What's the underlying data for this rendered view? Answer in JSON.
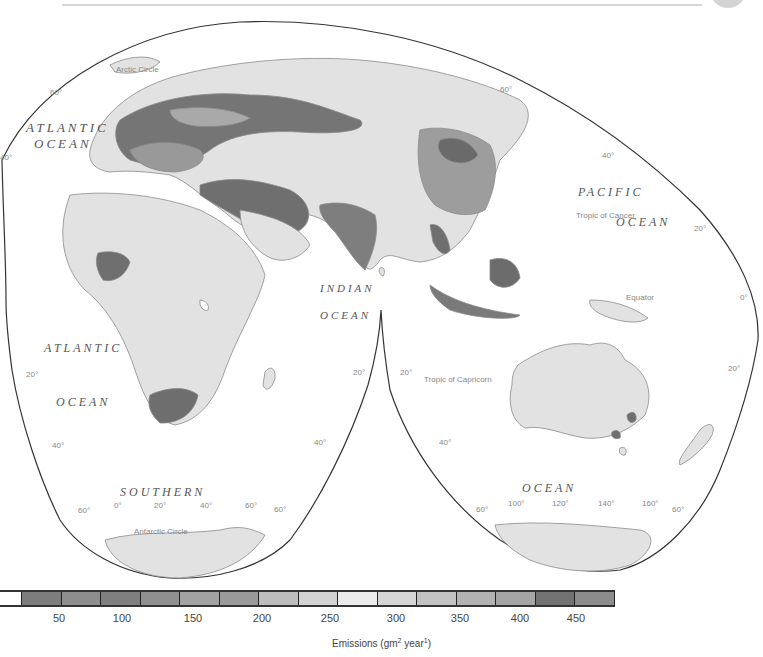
{
  "map": {
    "title": "Emissions map (Goode homolosine, interrupted)",
    "ocean_labels": {
      "atlantic_north": [
        "ATLANTIC",
        "OCEAN"
      ],
      "atlantic_south": [
        "ATLANTIC",
        "OCEAN"
      ],
      "pacific": [
        "PACIFIC",
        "OCEAN"
      ],
      "indian": [
        "INDIAN",
        "OCEAN"
      ],
      "southern": [
        "SOUTHERN",
        "OCEAN"
      ]
    },
    "lines": {
      "arctic_circle": "Arctic Circle",
      "tropic_of_cancer": "Tropic of Cancer",
      "equator": "Equator",
      "tropic_of_capricorn": "Tropic of Capricorn",
      "antarctic_circle": "Antarctic Circle"
    },
    "latitude_labels": {
      "nw_60": "60°",
      "w_40": "40°",
      "ne_60": "60°",
      "ne_40": "40°",
      "e_20": "20°",
      "e_0": "0°",
      "e_20s": "20°",
      "w_20s": "20°",
      "w_40s": "40°",
      "mid_20s_left": "20°",
      "mid_40s_left": "40°",
      "mid_20s_right": "20°",
      "mid_40s_right": "40°",
      "sw_60": "60°",
      "s_60_mid": "60°",
      "s_60_mid2": "60°",
      "se_60": "60°"
    },
    "longitude_labels": {
      "l0": "0°",
      "l20": "20°",
      "l40": "40°",
      "l60": "60°",
      "r100": "100°",
      "r120": "120°",
      "r140": "140°",
      "r160": "160°"
    },
    "colors": {
      "ocean": "#ffffff",
      "land_low": "#e2e2e2",
      "outline": "#333333",
      "coast": "#8a8a8a"
    }
  },
  "legend": {
    "title_main": "Emissions (gm",
    "title_sup1": "2",
    "title_mid": " year",
    "title_sup2": "1",
    "title_end": ")",
    "tick_labels": [
      "50",
      "100",
      "150",
      "200",
      "250",
      "300",
      "350",
      "400",
      "450"
    ],
    "swatches": [
      {
        "color": "#ffffff"
      },
      {
        "color": "#7d7d7d"
      },
      {
        "color": "#8e8e8e"
      },
      {
        "color": "#7f7f7f"
      },
      {
        "color": "#909090"
      },
      {
        "color": "#a2a2a2"
      },
      {
        "color": "#9a9a9a"
      },
      {
        "color": "#bdbdbd"
      },
      {
        "color": "#d3d3d3"
      },
      {
        "color": "#ececec"
      },
      {
        "color": "#d6d6d6"
      },
      {
        "color": "#c2c2c2"
      },
      {
        "color": "#b2b2b2"
      },
      {
        "color": "#a5a5a5"
      },
      {
        "color": "#727272"
      },
      {
        "color": "#8c8c8c"
      }
    ]
  }
}
